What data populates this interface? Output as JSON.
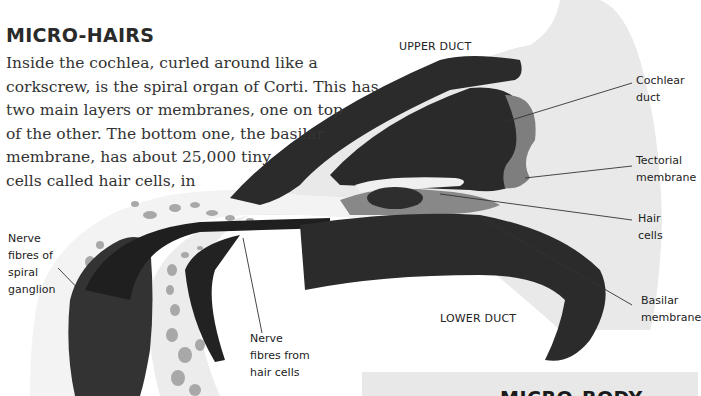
{
  "article": {
    "heading": "MICRO-HAIRS",
    "body_lines": [
      "Inside the cochlea, curled around like a",
      "corkscrew, is the spiral organ of Corti. This has",
      "two main layers or membranes, one on top",
      "of the other. The bottom one, the basilar",
      "membrane, has about 25,000 tiny",
      "cells called hair cells, in"
    ]
  },
  "diagram": {
    "region_labels": {
      "upper_duct": "UPPER DUCT",
      "lower_duct": "LOWER DUCT"
    },
    "callouts": {
      "cochlear_duct": [
        "Cochlear",
        "duct"
      ],
      "tectorial_membrane": [
        "Tectorial",
        "membrane"
      ],
      "hair_cells": [
        "Hair",
        "cells"
      ],
      "basilar_membrane": [
        "Basilar",
        "membrane"
      ],
      "nerve_fibres_spiral_ganglion": [
        "Nerve",
        "fibres of",
        "spiral",
        "ganglion"
      ],
      "nerve_fibres_hair_cells": [
        "Nerve",
        "fibres from",
        "hair cells"
      ]
    },
    "colors": {
      "background_fluid": "#e9e9e9",
      "dark_tissue": "#2b2b2b",
      "mid_tissue": "#7a7a7a",
      "bone_spots": "#a8a8a8",
      "leader_line": "#333333"
    }
  },
  "next_section": {
    "title": "MICRO-BODY"
  }
}
